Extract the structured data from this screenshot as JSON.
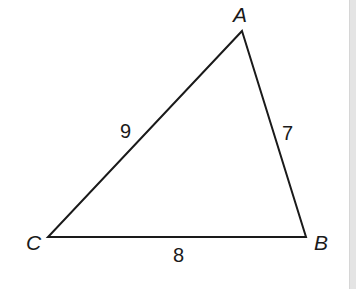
{
  "diagram": {
    "type": "triangle",
    "stroke_color": "#1a1a1a",
    "background": "#ffffff",
    "vertices": {
      "A": {
        "label": "A",
        "x": 242,
        "y": 31
      },
      "B": {
        "label": "B",
        "x": 306,
        "y": 237
      },
      "C": {
        "label": "C",
        "x": 48,
        "y": 237
      }
    },
    "sides": {
      "CA": {
        "label": "9"
      },
      "AB": {
        "label": "7"
      },
      "CB": {
        "label": "8"
      }
    }
  }
}
